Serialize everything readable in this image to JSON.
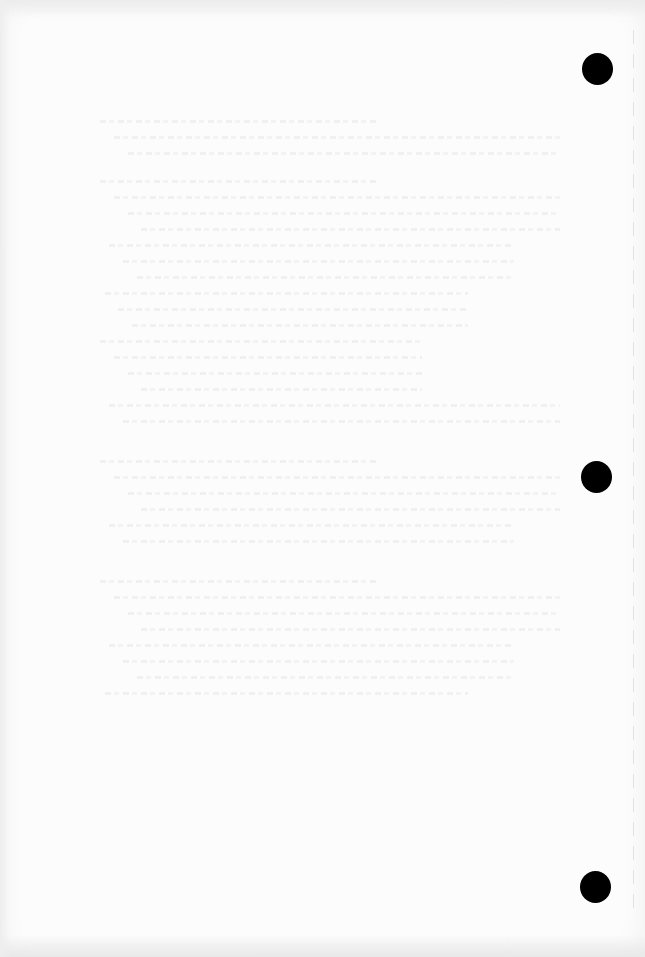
{
  "document": {
    "type": "scanned-blank-page",
    "background_color": "#fcfcfc",
    "bleed_through_text": "illegible",
    "punch_holes": [
      {
        "cx": 597,
        "cy": 69
      },
      {
        "cx": 596,
        "cy": 477
      },
      {
        "cx": 595,
        "cy": 887
      }
    ],
    "bleed_blocks": [
      {
        "top": 120,
        "lines": 3
      },
      {
        "top": 180,
        "lines": 16
      },
      {
        "top": 460,
        "lines": 6
      },
      {
        "top": 580,
        "lines": 8
      }
    ]
  }
}
